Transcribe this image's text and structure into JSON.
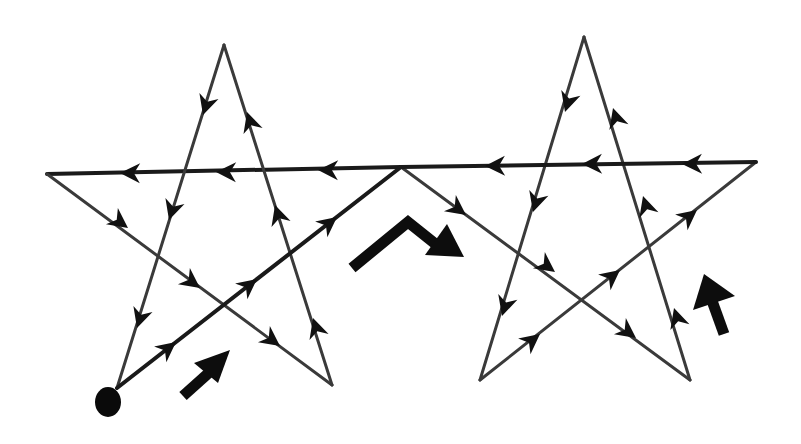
{
  "diagram": {
    "title": "",
    "colors": {
      "background": "#ffffff",
      "edge": "#3a3a3a",
      "arrow": "#111111",
      "start_dot": "#0a0a0a"
    },
    "start_point": {
      "x": 106,
      "y": 400,
      "label": ""
    },
    "left_star": {
      "vertices": {
        "top": [
          224,
          45
        ],
        "left": [
          47,
          174
        ],
        "right_junction": [
          401,
          167
        ],
        "bottom_left": [
          117,
          388
        ],
        "bottom_right": [
          332,
          385
        ]
      }
    },
    "right_star": {
      "vertices": {
        "top": [
          584,
          37
        ],
        "left_junction": [
          401,
          167
        ],
        "right": [
          756,
          162
        ],
        "bottom_left": [
          480,
          380
        ],
        "bottom_right": [
          690,
          380
        ]
      }
    },
    "direction_indicators": [
      {
        "name": "start-direction-arrow",
        "direction": "up-right"
      },
      {
        "name": "junction-direction-arrow",
        "direction": "over-peak-down-right"
      },
      {
        "name": "right-star-direction-arrow",
        "direction": "up"
      }
    ]
  }
}
